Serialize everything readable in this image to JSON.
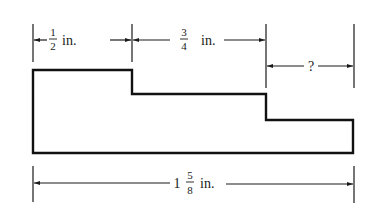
{
  "figure": {
    "dimensions": {
      "segment1": {
        "whole": "",
        "numerator": "1",
        "denominator": "2",
        "unit": "in."
      },
      "segment2": {
        "whole": "",
        "numerator": "3",
        "denominator": "4",
        "unit": "in."
      },
      "segment3": {
        "label": "?"
      },
      "total": {
        "whole": "1",
        "numerator": "5",
        "denominator": "8",
        "unit": "in."
      }
    },
    "colors": {
      "ink": "#1a1a1a",
      "background": "#ffffff"
    }
  }
}
